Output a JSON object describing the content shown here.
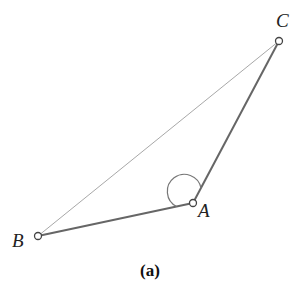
{
  "figure": {
    "caption": "(a)",
    "points": [
      {
        "name": "A",
        "label": "A",
        "x": 193,
        "y": 203,
        "lx": 198,
        "ly": 217
      },
      {
        "name": "B",
        "label": "B",
        "x": 38,
        "y": 236,
        "lx": 13,
        "ly": 246
      },
      {
        "name": "C",
        "label": "C",
        "x": 279,
        "y": 41,
        "lx": 276,
        "ly": 26
      }
    ],
    "segments": [
      {
        "from": "B",
        "to": "A",
        "style": "thick"
      },
      {
        "from": "A",
        "to": "C",
        "style": "thick"
      },
      {
        "from": "B",
        "to": "C",
        "style": "thin"
      }
    ],
    "angle_marker": {
      "at": "A",
      "between": [
        "B",
        "C"
      ],
      "radius": 14
    },
    "colors": {
      "thick": "#6b6b6b",
      "thin": "#a0a0a0",
      "text": "#222222"
    }
  }
}
